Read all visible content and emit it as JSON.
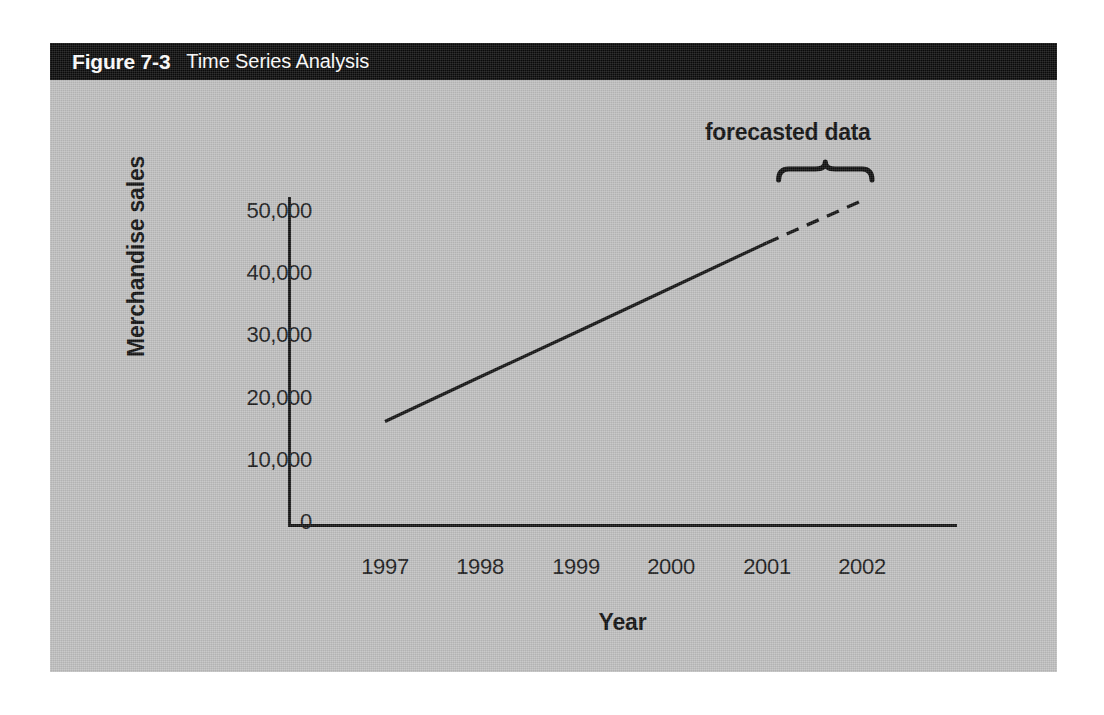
{
  "figure": {
    "number": "Figure 7-3",
    "title": "Time Series Analysis",
    "header_bg": "#0b0b0b",
    "header_fg": "#ffffff",
    "panel_bg": "#c0c0c0"
  },
  "chart_data": {
    "type": "line",
    "title": "Time Series Analysis",
    "xlabel": "Year",
    "ylabel": "Merchandise sales",
    "x": [
      1997,
      1998,
      1999,
      2000,
      2001,
      2002
    ],
    "xtick_labels": [
      "1997",
      "1998",
      "1999",
      "2000",
      "2001",
      "2002"
    ],
    "ytick_labels": [
      "50,000",
      "40,000",
      "30,000",
      "20,000",
      "10,000",
      "0"
    ],
    "ytick_values": [
      50000,
      40000,
      30000,
      20000,
      10000,
      0
    ],
    "ylim": [
      0,
      52000
    ],
    "grid": false,
    "legend": null,
    "series": [
      {
        "name": "Merchandise sales (actual)",
        "style": "solid",
        "color": "#131313",
        "x": [
          1997,
          1998,
          1999,
          2000,
          2001
        ],
        "values": [
          16000,
          23200,
          30300,
          37500,
          44700
        ]
      },
      {
        "name": "Merchandise sales (forecast)",
        "style": "dashed",
        "color": "#131313",
        "x": [
          2001,
          2002
        ],
        "values": [
          44700,
          51500
        ]
      }
    ],
    "annotations": [
      {
        "text": "forecasted data",
        "type": "brace-label",
        "spans_x": [
          2001,
          2002
        ]
      }
    ]
  }
}
